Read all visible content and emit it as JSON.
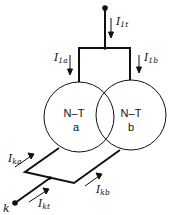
{
  "diagram": {
    "transformers": [
      {
        "id": "a",
        "title": "N–T",
        "sub": "a"
      },
      {
        "id": "b",
        "title": "N–T",
        "sub": "b"
      }
    ],
    "labels": {
      "I1t": {
        "main": "I",
        "sub": "1t"
      },
      "I1a": {
        "main": "I",
        "sub": "1a"
      },
      "I1b": {
        "main": "I",
        "sub": "1b"
      },
      "Ika": {
        "main": "I",
        "sub": "ka"
      },
      "Ikb": {
        "main": "I",
        "sub": "kb"
      },
      "Ikt": {
        "main": "I",
        "sub": "kt"
      },
      "node_k": "k"
    },
    "colors": {
      "line": "#111111",
      "background": "#ffffff"
    }
  }
}
